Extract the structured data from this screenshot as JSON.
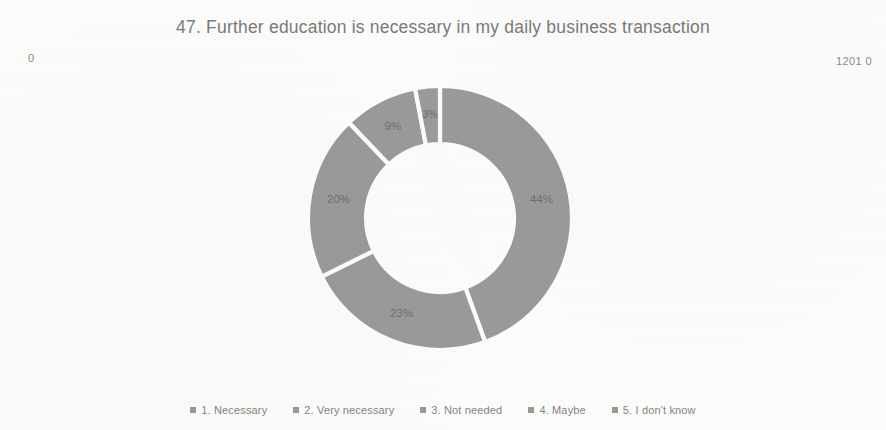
{
  "chart_data": {
    "type": "pie",
    "variant": "donut",
    "title": "47. Further education is necessary in my daily business transaction",
    "xlabel": "",
    "ylabel": "",
    "legend_position": "bottom",
    "grid": false,
    "start_angle_deg": 0,
    "direction": "clockwise",
    "inner_radius_ratio": 0.56,
    "categories": [
      "1. Necessary",
      "2. Very necessary",
      "3. Not needed",
      "4. Maybe",
      "5. I don't know"
    ],
    "values": [
      44,
      23,
      20,
      9,
      3
    ],
    "value_unit": "%",
    "data_labels": [
      "44%",
      "23%",
      "20%",
      "9%",
      "3%"
    ],
    "slice_colors": [
      "#9a9a9a",
      "#9a9a9a",
      "#9a9a9a",
      "#9a9a9a",
      "#9a9a9a"
    ],
    "separator_color": "#fcfcfb"
  },
  "corner_labels": {
    "left": "0",
    "right": "1201 0"
  },
  "legend": {
    "items": [
      {
        "label": "1. Necessary",
        "marker": "square-marker-icon",
        "color": "#9a9a9a"
      },
      {
        "label": "2. Very necessary",
        "marker": "square-marker-icon",
        "color": "#9a9a9a"
      },
      {
        "label": "3. Not needed",
        "marker": "square-marker-icon",
        "color": "#9a9a9a"
      },
      {
        "label": "4. Maybe",
        "marker": "square-marker-icon",
        "color": "#9a9a9a"
      },
      {
        "label": "5. I don't know",
        "marker": "square-marker-icon",
        "color": "#9a9a9a"
      }
    ]
  }
}
